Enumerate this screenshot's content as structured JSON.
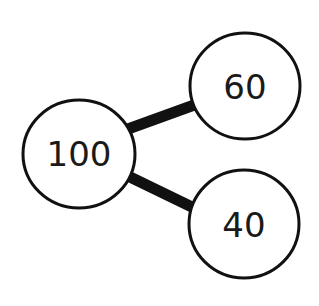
{
  "diagram": {
    "type": "part-whole number bond",
    "whole": {
      "label": "100"
    },
    "parts": [
      {
        "label": "60"
      },
      {
        "label": "40"
      }
    ],
    "colors": {
      "stroke": "#111111",
      "fill": "#ffffff",
      "text": "#1a1a1a"
    }
  }
}
